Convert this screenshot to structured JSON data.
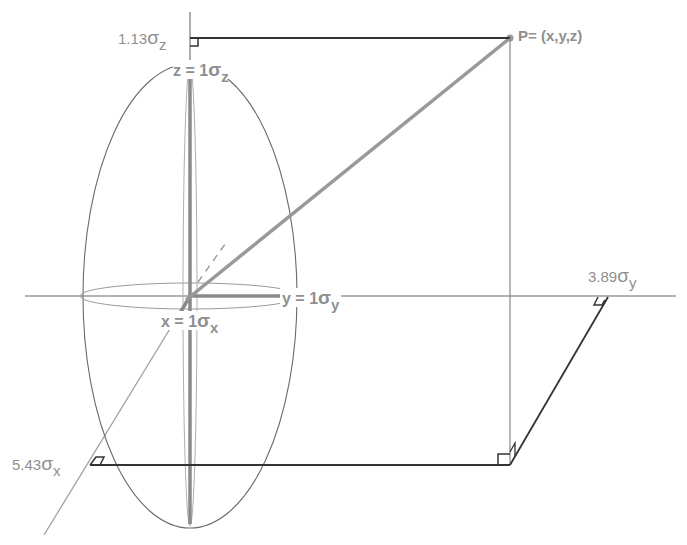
{
  "diagram": {
    "title": "",
    "point_label": "P= (x,y,z)",
    "labels": {
      "z_proj": {
        "value": "1.13",
        "sigma": "σ",
        "sub": "z"
      },
      "z_unit": {
        "prefix": "z = 1",
        "sigma": "σ",
        "sub": "z"
      },
      "y_unit": {
        "prefix": "y = 1",
        "sigma": "σ",
        "sub": "y"
      },
      "x_unit": {
        "prefix": "x = 1",
        "sigma": "σ",
        "sub": "x"
      },
      "y_proj": {
        "value": "3.89",
        "sigma": "σ",
        "sub": "y"
      },
      "x_proj": {
        "value": "5.43",
        "sigma": "σ",
        "sub": "x"
      }
    },
    "values": {
      "x_sigma": 5.43,
      "y_sigma": 3.89,
      "z_sigma": 1.13
    },
    "colors": {
      "axis": "#999999",
      "heavy_line": "#333333",
      "vector": "#999999",
      "ellipse": "#666666",
      "text": "#8f8f8f"
    }
  }
}
